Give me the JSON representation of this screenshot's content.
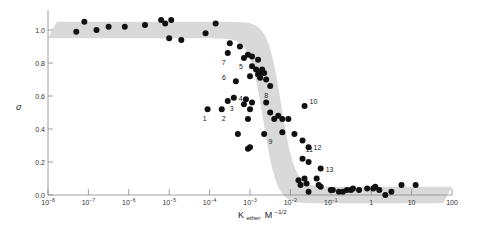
{
  "chart_data": {
    "type": "scatter",
    "title": "",
    "xlabel": "K ether M^-1/2",
    "xlabel_parts": {
      "main": "K",
      "sub": "ether",
      "unit": "M",
      "exp": "−1/2"
    },
    "ylabel": "σ",
    "xscale": "log",
    "xlim": [
      1e-08,
      100
    ],
    "ylim": [
      0.0,
      1.1
    ],
    "grid": false,
    "legend": null,
    "x_ticks": [
      {
        "exp": -8,
        "label": "10",
        "sup": "−8"
      },
      {
        "exp": -7,
        "label": "10",
        "sup": "−7"
      },
      {
        "exp": -6,
        "label": "10",
        "sup": "−6"
      },
      {
        "exp": -5,
        "label": "10",
        "sup": "−5"
      },
      {
        "exp": -4,
        "label": "10",
        "sup": "−4"
      },
      {
        "exp": -3,
        "label": "10",
        "sup": "−3"
      },
      {
        "exp": -2,
        "label": "10",
        "sup": "−2"
      },
      {
        "exp": -1,
        "label": "10",
        "sup": "−1"
      },
      {
        "exp": 0,
        "label": "1",
        "sup": ""
      },
      {
        "exp": 1,
        "label": "10",
        "sup": ""
      },
      {
        "exp": 2,
        "label": "100",
        "sup": ""
      }
    ],
    "y_ticks": [
      {
        "value": 0.0,
        "label": "0.0"
      },
      {
        "value": 0.2,
        "label": "0.2"
      },
      {
        "value": 0.4,
        "label": "0.4"
      },
      {
        "value": 0.6,
        "label": "0.6"
      },
      {
        "value": 0.8,
        "label": "0.8"
      },
      {
        "value": 1.0,
        "label": "1.0"
      }
    ],
    "band": {
      "description": "shaded sigmoid band, sigma ≈ 1 at low K dropping to ≈ 0 near K ≈ 3e-3",
      "color": "#d9d9d9",
      "half_width_y": 0.05,
      "midpoint_log10K": -2.45,
      "steepness": 2.6
    },
    "series": [
      {
        "name": "measurements",
        "color": "#111111",
        "points_log10x_y": [
          [
            -7.3,
            0.99
          ],
          [
            -7.1,
            1.05
          ],
          [
            -6.8,
            1.0
          ],
          [
            -6.5,
            1.02
          ],
          [
            -6.1,
            1.02
          ],
          [
            -5.6,
            1.03
          ],
          [
            -5.2,
            1.06
          ],
          [
            -5.1,
            1.04
          ],
          [
            -4.95,
            1.06
          ],
          [
            -5.0,
            0.95
          ],
          [
            -4.7,
            0.94
          ],
          [
            -4.1,
            0.98
          ],
          [
            -3.85,
            1.04
          ],
          [
            -3.5,
            0.92
          ],
          [
            -3.25,
            0.9
          ],
          [
            -3.05,
            0.85
          ],
          [
            -2.95,
            0.84
          ],
          [
            -2.8,
            0.82
          ],
          [
            -2.95,
            0.78
          ],
          [
            -2.85,
            0.76
          ],
          [
            -2.8,
            0.73
          ],
          [
            -2.75,
            0.71
          ],
          [
            -2.6,
            0.7
          ],
          [
            -2.65,
            0.74
          ],
          [
            -3.0,
            0.72
          ],
          [
            -2.75,
            0.74
          ],
          [
            -2.7,
            0.76
          ],
          [
            -3.15,
            0.55
          ],
          [
            -3.1,
            0.58
          ],
          [
            -3.0,
            0.52
          ],
          [
            -2.95,
            0.56
          ],
          [
            -3.05,
            0.46
          ],
          [
            -2.5,
            0.5
          ],
          [
            -2.4,
            0.46
          ],
          [
            -2.6,
            0.56
          ],
          [
            -3.3,
            0.37
          ],
          [
            -3.05,
            0.28
          ],
          [
            -3.0,
            0.29
          ],
          [
            -2.65,
            0.37
          ],
          [
            -2.3,
            0.48
          ],
          [
            -2.2,
            0.46
          ],
          [
            -2.05,
            0.46
          ],
          [
            -1.9,
            0.37
          ],
          [
            -1.8,
            0.09
          ],
          [
            -1.75,
            0.06
          ],
          [
            -1.65,
            0.1
          ],
          [
            -1.6,
            0.07
          ],
          [
            -1.55,
            0.02
          ],
          [
            -1.35,
            0.1
          ],
          [
            -1.3,
            0.06
          ],
          [
            -1.25,
            0.05
          ],
          [
            -1.0,
            0.03
          ],
          [
            -0.95,
            0.03
          ],
          [
            -0.8,
            0.02
          ],
          [
            -0.7,
            0.02
          ],
          [
            -0.6,
            0.03
          ],
          [
            -0.5,
            0.03
          ],
          [
            -0.45,
            0.04
          ],
          [
            -0.3,
            0.03
          ],
          [
            -0.1,
            0.04
          ],
          [
            0.05,
            0.04
          ],
          [
            0.1,
            0.05
          ],
          [
            0.2,
            0.03
          ],
          [
            0.35,
            0.0
          ],
          [
            0.5,
            0.02
          ],
          [
            0.75,
            0.06
          ],
          [
            1.1,
            0.06
          ],
          [
            -1.7,
            0.22
          ],
          [
            -1.55,
            0.2
          ]
        ]
      },
      {
        "name": "labelled outliers",
        "color": "#111111",
        "points": [
          {
            "id": "1",
            "log10x": -4.05,
            "y": 0.52
          },
          {
            "id": "2",
            "log10x": -3.7,
            "y": 0.52
          },
          {
            "id": "3",
            "log10x": -3.55,
            "y": 0.57
          },
          {
            "id": "4",
            "log10x": -3.4,
            "y": 0.59
          },
          {
            "id": "5",
            "log10x": -3.15,
            "y": 0.83
          },
          {
            "id": "6",
            "log10x": -3.35,
            "y": 0.69
          },
          {
            "id": "7",
            "log10x": -3.55,
            "y": 0.86
          },
          {
            "id": "8",
            "log10x": -2.5,
            "y": 0.66
          },
          {
            "id": "9",
            "log10x": -2.2,
            "y": 0.38
          },
          {
            "id": "10",
            "log10x": -1.65,
            "y": 0.54
          },
          {
            "id": "11",
            "log10x": -1.7,
            "y": 0.33
          },
          {
            "id": "12",
            "log10x": -1.55,
            "y": 0.29
          },
          {
            "id": "13",
            "log10x": -1.25,
            "y": 0.16
          }
        ]
      }
    ]
  },
  "plot_area": {
    "x0": 48,
    "x_per_decade": 40.4,
    "y0": 195,
    "y_per_unit": 165
  }
}
